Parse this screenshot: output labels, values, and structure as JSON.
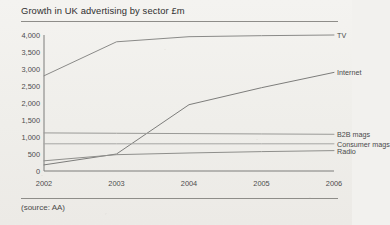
{
  "figure": {
    "title": "Growth in UK advertising by sector £m",
    "source": "(source: AA)"
  },
  "chart_data": {
    "type": "line",
    "title": "Growth in UK advertising by sector £m",
    "subtitle": "",
    "xlabel": "",
    "ylabel": "£m",
    "source": "(source: AA)",
    "categories": [
      "2002",
      "2003",
      "2004",
      "2005",
      "2006"
    ],
    "x": [
      2002,
      2003,
      2004,
      2005,
      2006
    ],
    "xlim": [
      2002,
      2006
    ],
    "ylim": [
      0,
      4000
    ],
    "yticks": [
      0,
      500,
      1000,
      1500,
      2000,
      2500,
      3000,
      3500,
      4000
    ],
    "ytick_labels": [
      "0",
      "500",
      "1,000",
      "1,500",
      "2,000",
      "2,500",
      "3,000",
      "3,500",
      "4,000"
    ],
    "grid": false,
    "legend_position": "right-inline-labels",
    "series": [
      {
        "name": "TV",
        "label": "TV",
        "color": "#8a8a88",
        "values": [
          2800,
          3800,
          3950,
          3980,
          4000
        ]
      },
      {
        "name": "Internet",
        "label": "Internet",
        "color": "#7d7d7b",
        "values": [
          180,
          500,
          1950,
          2450,
          2900
        ]
      },
      {
        "name": "B2B mags",
        "label": "B2B mags",
        "color": "#9a9a97",
        "values": [
          1120,
          1110,
          1100,
          1090,
          1080
        ]
      },
      {
        "name": "Consumer mags",
        "label": "Consumer mags",
        "color": "#a6a6a3",
        "values": [
          800,
          800,
          800,
          800,
          800
        ]
      },
      {
        "name": "Radio",
        "label": "Radio",
        "color": "#8f8f8c",
        "values": [
          300,
          480,
          530,
          570,
          600
        ]
      }
    ]
  }
}
